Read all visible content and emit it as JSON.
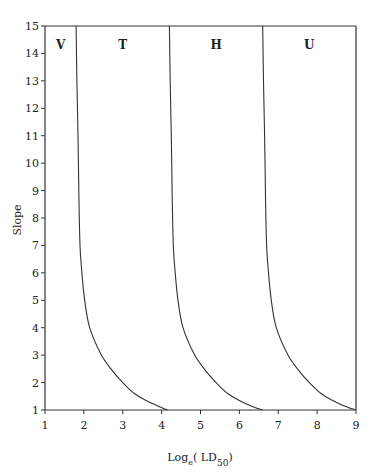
{
  "chart_data": {
    "type": "line",
    "title": "",
    "xlabel": "Log_e(LD_50)",
    "xlabel_parts": {
      "main": "Log",
      "sub1": "e",
      "mid": "( LD",
      "sub2": "50",
      "end": ")"
    },
    "ylabel": "Slope",
    "xlim": [
      1,
      9
    ],
    "ylim": [
      1,
      15
    ],
    "xticks": [
      1,
      2,
      3,
      4,
      5,
      6,
      7,
      8,
      9
    ],
    "yticks": [
      1,
      2,
      3,
      4,
      5,
      6,
      7,
      8,
      9,
      10,
      11,
      12,
      13,
      14,
      15
    ],
    "grid": false,
    "legend": "none",
    "region_labels": [
      {
        "label": "V",
        "x": 1.4,
        "y": 14.3
      },
      {
        "label": "T",
        "x": 3.0,
        "y": 14.3
      },
      {
        "label": "H",
        "x": 5.4,
        "y": 14.3
      },
      {
        "label": "U",
        "x": 7.8,
        "y": 14.3
      }
    ],
    "series": [
      {
        "name": "V/T boundary",
        "points": [
          [
            1.8,
            15
          ],
          [
            1.82,
            13
          ],
          [
            1.85,
            11
          ],
          [
            1.87,
            9
          ],
          [
            1.9,
            7
          ],
          [
            1.95,
            6
          ],
          [
            2.02,
            5
          ],
          [
            2.15,
            4
          ],
          [
            2.45,
            3
          ],
          [
            2.75,
            2.4
          ],
          [
            3.0,
            2.0
          ],
          [
            3.3,
            1.6
          ],
          [
            3.6,
            1.35
          ],
          [
            3.9,
            1.15
          ],
          [
            4.15,
            1.0
          ]
        ]
      },
      {
        "name": "T/H boundary",
        "points": [
          [
            4.2,
            15
          ],
          [
            4.22,
            13
          ],
          [
            4.25,
            11
          ],
          [
            4.27,
            9
          ],
          [
            4.3,
            7
          ],
          [
            4.35,
            6
          ],
          [
            4.42,
            5
          ],
          [
            4.55,
            4
          ],
          [
            4.85,
            3
          ],
          [
            5.15,
            2.4
          ],
          [
            5.4,
            2.0
          ],
          [
            5.7,
            1.6
          ],
          [
            6.0,
            1.35
          ],
          [
            6.3,
            1.15
          ],
          [
            6.6,
            1.0
          ]
        ]
      },
      {
        "name": "H/U boundary",
        "points": [
          [
            6.6,
            15
          ],
          [
            6.62,
            13
          ],
          [
            6.65,
            11
          ],
          [
            6.67,
            9
          ],
          [
            6.7,
            7
          ],
          [
            6.75,
            6
          ],
          [
            6.82,
            5
          ],
          [
            6.95,
            4
          ],
          [
            7.25,
            3
          ],
          [
            7.55,
            2.4
          ],
          [
            7.8,
            2.0
          ],
          [
            8.1,
            1.6
          ],
          [
            8.4,
            1.35
          ],
          [
            8.7,
            1.15
          ],
          [
            9.0,
            1.0
          ]
        ]
      }
    ],
    "frame": {
      "top_line": true,
      "right_line_at_x": 9
    }
  }
}
